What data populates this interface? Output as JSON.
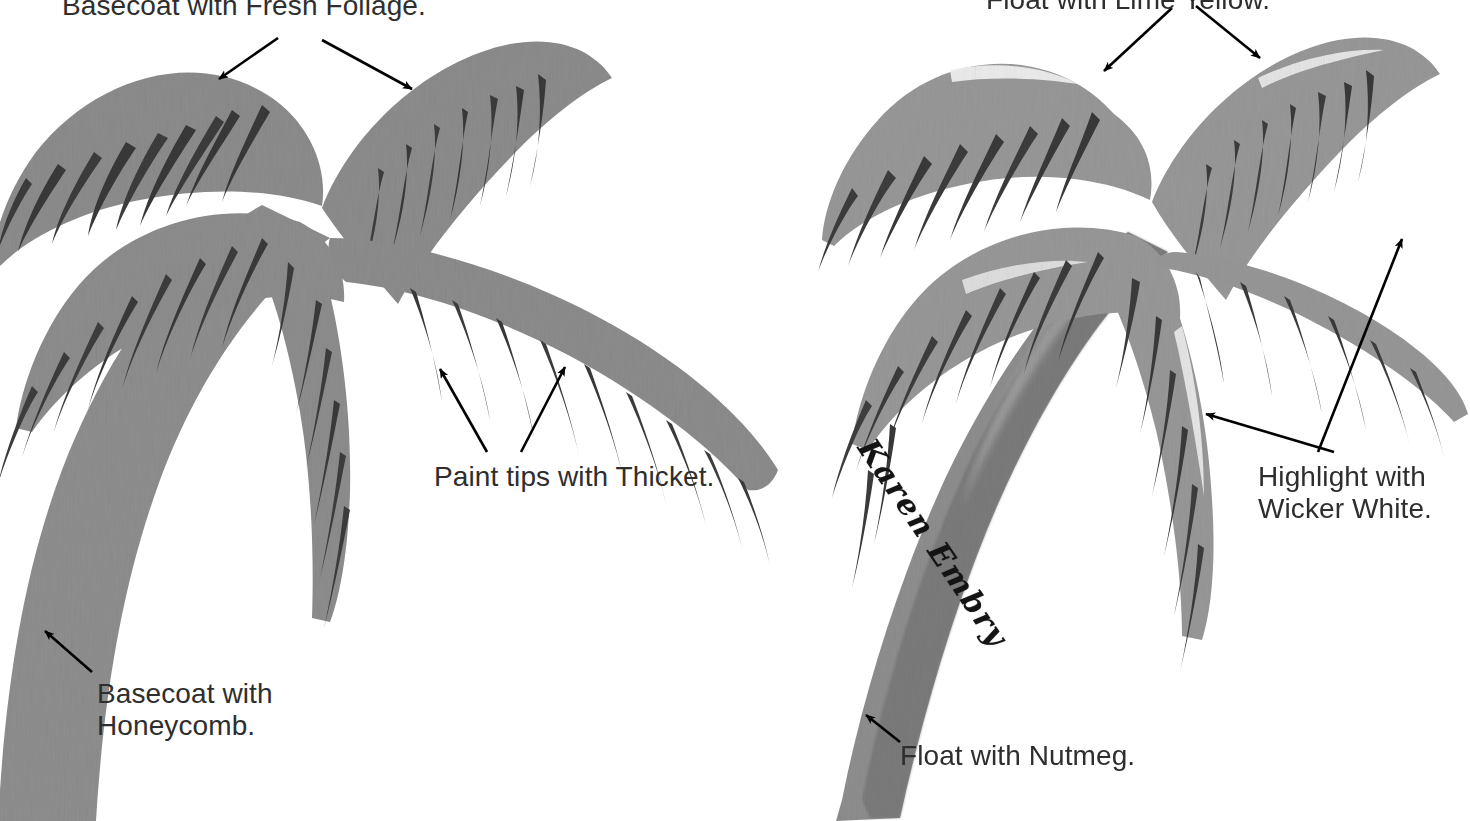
{
  "page": {
    "background_color": "#ffffff",
    "width": 1470,
    "height": 821
  },
  "palette": {
    "frond_gray": "#8c8c8c",
    "frond_gray_light": "#9a9a9a",
    "leaf_dark": "#3a3a3a",
    "leaf_dark_soft": "#4a4a4a",
    "trunk_gray": "#8a8a8a",
    "trunk_shade": "#6f6f6f",
    "highlight_white": "#f2f2f2",
    "text_color": "#2e2e2e",
    "arrow_color": "#000000"
  },
  "labels": {
    "foliage": {
      "text": "Basecoat with Fresh Foliage.",
      "color_name": "Fresh Foliage",
      "step": "Basecoat"
    },
    "thicket": {
      "text": "Paint tips with Thicket.",
      "color_name": "Thicket",
      "step": "Paint tips"
    },
    "honeycomb": {
      "text": "Basecoat with\nHoneycomb.",
      "color_name": "Honeycomb",
      "step": "Basecoat"
    },
    "lime": {
      "text": "Float with Lime Yellow.",
      "color_name": "Lime Yellow",
      "step": "Float"
    },
    "wicker": {
      "text": "Highlight with\nWicker White.",
      "color_name": "Wicker White",
      "step": "Highlight"
    },
    "nutmeg": {
      "text": "Float with Nutmeg.",
      "color_name": "Nutmeg",
      "step": "Float"
    }
  },
  "signature": {
    "text": "Karen Embry",
    "style": "ornate-script",
    "rotation_degrees": 56
  },
  "figures": [
    {
      "id": "left-palm",
      "caption_group": "basecoat-stage",
      "labels": [
        "foliage",
        "thicket",
        "honeycomb"
      ]
    },
    {
      "id": "right-palm",
      "caption_group": "float-highlight-stage",
      "labels": [
        "lime",
        "wicker",
        "nutmeg"
      ]
    }
  ],
  "arrows": [
    {
      "name": "arrow-foliage-left",
      "from": [
        278,
        38
      ],
      "to": [
        215,
        82
      ]
    },
    {
      "name": "arrow-foliage-right",
      "from": [
        320,
        40
      ],
      "to": [
        418,
        93
      ]
    },
    {
      "name": "arrow-thicket-left",
      "from": [
        487,
        452
      ],
      "to": [
        437,
        364
      ]
    },
    {
      "name": "arrow-thicket-right",
      "from": [
        521,
        452
      ],
      "to": [
        568,
        362
      ]
    },
    {
      "name": "arrow-honeycomb",
      "from": [
        92,
        672
      ],
      "to": [
        41,
        627
      ]
    },
    {
      "name": "arrow-lime-left",
      "from": [
        1172,
        10
      ],
      "to": [
        1100,
        76
      ]
    },
    {
      "name": "arrow-lime-right",
      "from": [
        1196,
        8
      ],
      "to": [
        1266,
        62
      ]
    },
    {
      "name": "arrow-wicker-lower",
      "from": [
        1332,
        452
      ],
      "to": [
        1200,
        412
      ]
    },
    {
      "name": "arrow-wicker-upper",
      "from": [
        1318,
        452
      ],
      "to": [
        1404,
        233
      ]
    },
    {
      "name": "arrow-nutmeg",
      "from": [
        898,
        742
      ],
      "to": [
        862,
        712
      ]
    }
  ]
}
